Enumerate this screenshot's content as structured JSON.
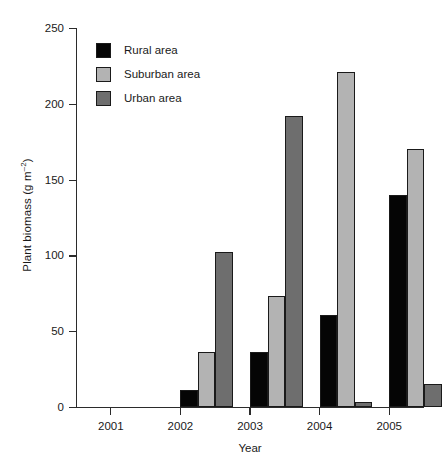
{
  "chart_data": {
    "type": "bar",
    "title": "",
    "xlabel": "Year",
    "ylabel": "Plant biomass (g m-2)",
    "ylabel_base": "Plant biomass (g m",
    "ylabel_sup": "–2",
    "ylabel_tail": ")",
    "categories": [
      "2001",
      "2002",
      "2003",
      "2004",
      "2005"
    ],
    "series": [
      {
        "name": "Rural area",
        "color": "#050505",
        "values": [
          0,
          11,
          36,
          61,
          140
        ]
      },
      {
        "name": "Suburban area",
        "color": "#b3b3b3",
        "values": [
          0,
          36,
          73,
          221,
          170
        ]
      },
      {
        "name": "Urban area",
        "color": "#6e6e6e",
        "values": [
          0,
          102,
          192,
          3,
          15
        ]
      }
    ],
    "ylim": [
      0,
      250
    ],
    "yticks": [
      0,
      50,
      100,
      150,
      200,
      250
    ],
    "ytick_labels": [
      "0",
      "50",
      "100",
      "150",
      "200",
      "250"
    ],
    "grid": false,
    "legend_position": "upper-left-inside"
  },
  "legend": {
    "items": [
      {
        "label": "Rural area",
        "color": "#050505"
      },
      {
        "label": "Suburban area",
        "color": "#b3b3b3"
      },
      {
        "label": "Urban area",
        "color": "#6e6e6e"
      }
    ]
  },
  "axes": {
    "x_title": "Year",
    "y_title": "Plant biomass (g m-2)"
  }
}
